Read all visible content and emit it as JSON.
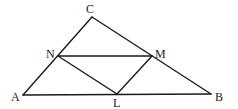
{
  "diagram": {
    "type": "geometry-triangle",
    "points": {
      "A": {
        "label": "A",
        "x": 23,
        "y": 95
      },
      "B": {
        "label": "B",
        "x": 211,
        "y": 94
      },
      "C": {
        "label": "C",
        "x": 92,
        "y": 17
      },
      "N": {
        "label": "N",
        "x": 58,
        "y": 56
      },
      "M": {
        "label": "M",
        "x": 152,
        "y": 56
      },
      "L": {
        "label": "L",
        "x": 117,
        "y": 94
      }
    },
    "segments": [
      [
        "A",
        "B"
      ],
      [
        "B",
        "C"
      ],
      [
        "C",
        "A"
      ],
      [
        "N",
        "M"
      ],
      [
        "M",
        "L"
      ],
      [
        "L",
        "N"
      ]
    ],
    "stroke_color": "#1a1a1a",
    "background_color": "#ffffff"
  }
}
